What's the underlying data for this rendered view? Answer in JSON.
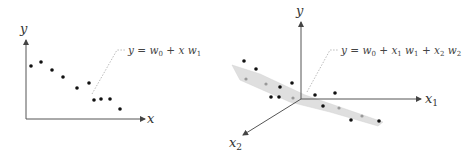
{
  "left_plot": {
    "title": "Simple linear regression",
    "y_label": "y",
    "x_label": "x",
    "equation": "y = w0 + x w1",
    "equation_parts": {
      "y": "y",
      "eq": " = ",
      "w": "w",
      "w_sub0": "0",
      "plus": " + ",
      "x": "x",
      "w2": "w",
      "w_sub1": "1"
    },
    "points": [
      [
        31,
        66
      ],
      [
        41,
        62
      ],
      [
        52,
        70
      ],
      [
        63,
        77
      ],
      [
        77,
        88
      ],
      [
        89,
        83
      ],
      [
        94,
        100
      ],
      [
        101,
        99
      ],
      [
        110,
        99
      ],
      [
        120,
        109
      ]
    ]
  },
  "right_plot": {
    "title": "Multiple linear regression",
    "y_label": "y",
    "x1_label": "x",
    "x1_sub": "1",
    "x2_label": "x",
    "x2_sub": "2",
    "equation": "y = w0 + x1 w1 + x2 w2",
    "points_front": [
      [
        244,
        61
      ],
      [
        256,
        69
      ],
      [
        280,
        87
      ],
      [
        292,
        83
      ],
      [
        271,
        97
      ],
      [
        279,
        97
      ],
      [
        315,
        95
      ],
      [
        335,
        93
      ],
      [
        323,
        106
      ],
      [
        351,
        120
      ],
      [
        379,
        121
      ]
    ],
    "points_on_plane": [
      [
        246,
        79
      ],
      [
        266,
        84
      ],
      [
        293,
        98
      ],
      [
        339,
        108
      ],
      [
        362,
        116
      ]
    ]
  },
  "colors": {
    "axis": "#555555",
    "point": "#111111",
    "plane": "#d9d9d9",
    "plane_edge": "#c8c8c8",
    "leader": "#aaaaaa"
  }
}
